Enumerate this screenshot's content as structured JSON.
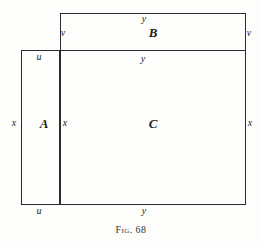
{
  "figure": {
    "caption_prefix": "Fig.",
    "caption_number": "68",
    "background_color": "#fdfdfc",
    "line_color": "#2b2b2b"
  },
  "regions": [
    {
      "id": "A",
      "label": "A"
    },
    {
      "id": "B",
      "label": "B"
    },
    {
      "id": "C",
      "label": "C"
    }
  ],
  "labels": {
    "v_left": "v",
    "v_right": "v",
    "y_top": "y",
    "u_top": "u",
    "y_mid": "y",
    "x_left": "x",
    "x_mid": "x",
    "x_right": "x",
    "u_bottom": "u",
    "y_bottom": "y"
  },
  "chart_data": {
    "type": "diagram",
    "title": "Fig. 68",
    "rectangles": [
      {
        "name": "B",
        "x": 60,
        "y": 13,
        "width": 186,
        "height": 38,
        "side_labels": {
          "top": "y",
          "left": "v",
          "right": "v"
        }
      },
      {
        "name": "A",
        "x": 21,
        "y": 50,
        "width": 39,
        "height": 155,
        "side_labels": {
          "top": "u",
          "bottom": "u",
          "left": "x",
          "right": "x"
        }
      },
      {
        "name": "C",
        "x": 60,
        "y": 50,
        "width": 186,
        "height": 155,
        "side_labels": {
          "top": "y",
          "bottom": "y",
          "left": "x",
          "right": "x"
        }
      }
    ]
  }
}
